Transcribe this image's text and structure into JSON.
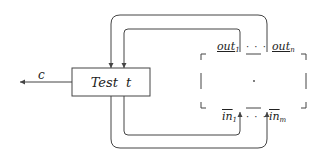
{
  "diagram": {
    "test_box": {
      "label": "Test  t"
    },
    "output_edge": {
      "label": "c"
    },
    "outputs": {
      "first": "out",
      "first_sub": "1",
      "dots": "· · ·",
      "last": "out",
      "last_sub": "n"
    },
    "inputs": {
      "first": "in",
      "first_sub": "1",
      "dots": "· · ·",
      "last": "in",
      "last_sub": "m"
    },
    "colors": {
      "line": "#444444",
      "text": "#222222",
      "background": "#ffffff"
    }
  }
}
